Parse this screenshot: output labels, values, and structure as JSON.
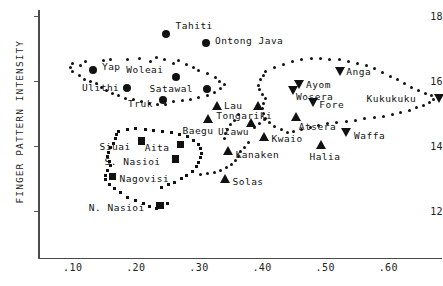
{
  "chart_data": {
    "type": "scatter",
    "title": "",
    "xlabel": "",
    "ylabel": "FINGER PATTERN INTENSITY",
    "xlim": [
      0.045,
      0.685
    ],
    "ylim": [
      10.55,
      18.2
    ],
    "grid": false,
    "legend": "none",
    "xticks": [
      ".10",
      ".20",
      ".30",
      ".40",
      ".50",
      ".60"
    ],
    "xtick_values": [
      0.1,
      0.2,
      0.3,
      0.4,
      0.5,
      0.6
    ],
    "yticks": [
      "18",
      "16",
      "14",
      "12"
    ],
    "ytick_values": [
      18,
      16,
      14,
      12
    ],
    "labeled_points": [
      {
        "name": "Tahiti",
        "marker": "circle",
        "x": 0.247,
        "y": 17.46,
        "label_dx": 10,
        "label_dy": -9
      },
      {
        "name": "Ontong Java",
        "marker": "circle",
        "x": 0.311,
        "y": 17.18,
        "label_dx": 9,
        "label_dy": -3
      },
      {
        "name": "Yap",
        "marker": "circle",
        "x": 0.132,
        "y": 16.35,
        "label_dx": 9,
        "label_dy": -4
      },
      {
        "name": "Woleai",
        "marker": "circle",
        "x": 0.264,
        "y": 16.12,
        "label_dx": -50,
        "label_dy": -8
      },
      {
        "name": "Ulithi",
        "marker": "circle",
        "x": 0.186,
        "y": 15.8,
        "label_dx": -45,
        "label_dy": -1
      },
      {
        "name": "Satawal",
        "marker": "circle",
        "x": 0.312,
        "y": 15.76,
        "label_dx": -57,
        "label_dy": -1
      },
      {
        "name": "Truk",
        "marker": "circle",
        "x": 0.243,
        "y": 15.42,
        "label_dx": -35,
        "label_dy": 3
      },
      {
        "name": "Lau",
        "marker": "tri-up",
        "x": 0.33,
        "y": 15.22,
        "label_dx": 6,
        "label_dy": -1
      },
      {
        "name": "Tongariki",
        "marker": "tri-up",
        "x": 0.394,
        "y": 15.22,
        "label_dx": -42,
        "label_dy": 9
      },
      {
        "name": "Baegu",
        "marker": "tri-up",
        "x": 0.315,
        "y": 14.83,
        "label_dx": -26,
        "label_dy": 11
      },
      {
        "name": "Ulawu",
        "marker": "tri-up",
        "x": 0.384,
        "y": 14.71,
        "label_dx": -34,
        "label_dy": 8
      },
      {
        "name": "Kwaio",
        "marker": "tri-up",
        "x": 0.404,
        "y": 14.27,
        "label_dx": 7,
        "label_dy": 1
      },
      {
        "name": "Kanaken",
        "marker": "tri-up",
        "x": 0.347,
        "y": 13.83,
        "label_dx": 7,
        "label_dy": 3
      },
      {
        "name": "Solas",
        "marker": "tri-up",
        "x": 0.342,
        "y": 12.99,
        "label_dx": 7,
        "label_dy": 2
      },
      {
        "name": "Siuai",
        "marker": "square",
        "x": 0.209,
        "y": 14.15,
        "label_dx": -42,
        "label_dy": 5
      },
      {
        "name": "Aita",
        "marker": "square",
        "x": 0.271,
        "y": 14.05,
        "label_dx": -36,
        "label_dy": 3
      },
      {
        "name": "S. Nasioi",
        "marker": "square",
        "x": 0.263,
        "y": 13.6,
        "label_dx": -71,
        "label_dy": 2
      },
      {
        "name": "Nagovisi",
        "marker": "square",
        "x": 0.163,
        "y": 13.06,
        "label_dx": 7,
        "label_dy": 2
      },
      {
        "name": "N. Nasioi",
        "marker": "square",
        "x": 0.238,
        "y": 12.15,
        "label_dx": -71,
        "label_dy": 1
      },
      {
        "name": "Ayom",
        "marker": "tri-down",
        "x": 0.46,
        "y": 15.91,
        "label_dx": 6,
        "label_dy": 0
      },
      {
        "name": "Wosera",
        "marker": "tri-down",
        "x": 0.449,
        "y": 15.7,
        "label_dx": 3,
        "label_dy": 5
      },
      {
        "name": "Fore",
        "marker": "tri-down",
        "x": 0.481,
        "y": 15.34,
        "label_dx": 6,
        "label_dy": 1
      },
      {
        "name": "Anga",
        "marker": "tri-down",
        "x": 0.524,
        "y": 16.3,
        "label_dx": 6,
        "label_dy": 0
      },
      {
        "name": "Atsera",
        "marker": "tri-up",
        "x": 0.455,
        "y": 14.88,
        "label_dx": 2,
        "label_dy": 9
      },
      {
        "name": "Waffa",
        "marker": "tri-down",
        "x": 0.533,
        "y": 14.4,
        "label_dx": 8,
        "label_dy": 2
      },
      {
        "name": "Kukukuku",
        "marker": "tri-down",
        "x": 0.681,
        "y": 15.48,
        "label_dx": -73,
        "label_dy": 0
      },
      {
        "name": "Halia",
        "marker": "tri-up",
        "x": 0.494,
        "y": 14.03,
        "label_dx": -12,
        "label_dy": 11
      }
    ],
    "cluster_outlines": [
      {
        "name": "micronesia-circles",
        "marker": "dot-round",
        "points": [
          [
            0.1,
            16.56
          ],
          [
            0.112,
            16.5
          ],
          [
            0.12,
            16.62
          ],
          [
            0.148,
            16.63
          ],
          [
            0.16,
            16.68
          ],
          [
            0.187,
            16.66
          ],
          [
            0.205,
            16.7
          ],
          [
            0.224,
            16.6
          ],
          [
            0.232,
            16.72
          ],
          [
            0.246,
            16.66
          ],
          [
            0.259,
            16.56
          ],
          [
            0.268,
            16.63
          ],
          [
            0.281,
            16.51
          ],
          [
            0.292,
            16.42
          ],
          [
            0.3,
            16.32
          ],
          [
            0.313,
            16.24
          ],
          [
            0.326,
            16.12
          ],
          [
            0.333,
            16.0
          ],
          [
            0.341,
            15.9
          ],
          [
            0.334,
            15.78
          ],
          [
            0.325,
            15.66
          ],
          [
            0.314,
            15.56
          ],
          [
            0.3,
            15.49
          ],
          [
            0.287,
            15.44
          ],
          [
            0.274,
            15.41
          ],
          [
            0.26,
            15.37
          ],
          [
            0.247,
            15.29
          ],
          [
            0.234,
            15.28
          ],
          [
            0.222,
            15.3
          ],
          [
            0.209,
            15.37
          ],
          [
            0.196,
            15.42
          ],
          [
            0.183,
            15.48
          ],
          [
            0.173,
            15.56
          ],
          [
            0.163,
            15.62
          ],
          [
            0.154,
            15.7
          ],
          [
            0.146,
            15.8
          ],
          [
            0.138,
            15.92
          ],
          [
            0.128,
            15.98
          ],
          [
            0.118,
            16.06
          ],
          [
            0.11,
            16.18
          ],
          [
            0.1,
            16.3
          ],
          [
            0.096,
            16.42
          ]
        ]
      },
      {
        "name": "melanesia-squares",
        "marker": "dot-square",
        "points": [
          [
            0.172,
            14.45
          ],
          [
            0.186,
            14.52
          ],
          [
            0.2,
            14.55
          ],
          [
            0.215,
            14.5
          ],
          [
            0.228,
            14.47
          ],
          [
            0.242,
            14.44
          ],
          [
            0.256,
            14.4
          ],
          [
            0.269,
            14.35
          ],
          [
            0.282,
            14.28
          ],
          [
            0.292,
            14.18
          ],
          [
            0.299,
            14.05
          ],
          [
            0.303,
            13.92
          ],
          [
            0.304,
            13.78
          ],
          [
            0.303,
            13.64
          ],
          [
            0.3,
            13.5
          ],
          [
            0.296,
            13.36
          ],
          [
            0.29,
            13.22
          ],
          [
            0.281,
            13.1
          ],
          [
            0.272,
            12.98
          ],
          [
            0.262,
            12.88
          ],
          [
            0.251,
            12.8
          ],
          [
            0.24,
            12.72
          ],
          [
            0.25,
            12.22
          ],
          [
            0.243,
            12.1
          ],
          [
            0.232,
            12.05
          ],
          [
            0.222,
            12.12
          ],
          [
            0.212,
            12.22
          ],
          [
            0.2,
            12.32
          ],
          [
            0.186,
            12.42
          ],
          [
            0.176,
            12.55
          ],
          [
            0.166,
            12.68
          ],
          [
            0.158,
            12.82
          ],
          [
            0.152,
            12.96
          ],
          [
            0.152,
            13.1
          ],
          [
            0.155,
            13.24
          ],
          [
            0.16,
            13.38
          ],
          [
            0.158,
            13.52
          ],
          [
            0.155,
            13.66
          ],
          [
            0.156,
            13.8
          ],
          [
            0.16,
            13.94
          ],
          [
            0.164,
            14.08
          ],
          [
            0.168,
            14.22
          ],
          [
            0.17,
            14.34
          ]
        ]
      },
      {
        "name": "newguinea-triangles",
        "marker": "dot-round",
        "points": [
          [
            0.406,
            16.3
          ],
          [
            0.42,
            16.42
          ],
          [
            0.434,
            16.52
          ],
          [
            0.448,
            16.6
          ],
          [
            0.463,
            16.66
          ],
          [
            0.478,
            16.7
          ],
          [
            0.492,
            16.7
          ],
          [
            0.507,
            16.68
          ],
          [
            0.522,
            16.66
          ],
          [
            0.537,
            16.62
          ],
          [
            0.551,
            16.56
          ],
          [
            0.565,
            16.48
          ],
          [
            0.578,
            16.38
          ],
          [
            0.591,
            16.28
          ],
          [
            0.603,
            16.16
          ],
          [
            0.614,
            16.04
          ],
          [
            0.625,
            15.92
          ],
          [
            0.636,
            15.8
          ],
          [
            0.648,
            15.7
          ],
          [
            0.659,
            15.62
          ],
          [
            0.668,
            15.56
          ],
          [
            0.672,
            15.44
          ],
          [
            0.665,
            15.34
          ],
          [
            0.655,
            15.26
          ],
          [
            0.645,
            15.18
          ],
          [
            0.633,
            15.1
          ],
          [
            0.62,
            15.02
          ],
          [
            0.606,
            14.96
          ],
          [
            0.592,
            14.92
          ],
          [
            0.578,
            14.88
          ],
          [
            0.563,
            14.84
          ],
          [
            0.548,
            14.8
          ],
          [
            0.533,
            14.76
          ],
          [
            0.518,
            14.72
          ],
          [
            0.504,
            14.68
          ],
          [
            0.49,
            14.63
          ],
          [
            0.476,
            14.58
          ],
          [
            0.462,
            14.52
          ],
          [
            0.45,
            14.46
          ],
          [
            0.44,
            14.4
          ],
          [
            0.43,
            14.5
          ],
          [
            0.42,
            14.6
          ],
          [
            0.412,
            14.72
          ],
          [
            0.406,
            14.86
          ],
          [
            0.402,
            15.0
          ],
          [
            0.4,
            15.16
          ],
          [
            0.402,
            15.32
          ],
          [
            0.406,
            15.46
          ],
          [
            0.4,
            15.6
          ],
          [
            0.396,
            15.74
          ],
          [
            0.395,
            15.88
          ],
          [
            0.398,
            16.04
          ],
          [
            0.402,
            16.18
          ]
        ]
      },
      {
        "name": "solomon-triangle-arc",
        "marker": "dot-round",
        "points": [
          [
            0.378,
            14.1
          ],
          [
            0.372,
            13.96
          ],
          [
            0.366,
            13.82
          ],
          [
            0.362,
            13.68
          ],
          [
            0.358,
            13.54
          ],
          [
            0.352,
            13.42
          ],
          [
            0.344,
            13.32
          ],
          [
            0.334,
            13.24
          ],
          [
            0.324,
            13.18
          ],
          [
            0.313,
            13.14
          ],
          [
            0.303,
            13.12
          ],
          [
            0.362,
            14.96
          ],
          [
            0.356,
            14.8
          ],
          [
            0.35,
            14.66
          ],
          [
            0.345,
            14.52
          ],
          [
            0.342,
            14.38
          ],
          [
            0.34,
            14.24
          ],
          [
            0.388,
            14.58
          ],
          [
            0.396,
            14.7
          ],
          [
            0.404,
            14.82
          ]
        ]
      }
    ]
  }
}
